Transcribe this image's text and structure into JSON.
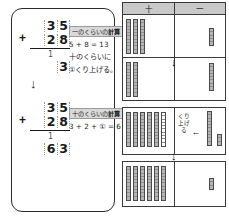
{
  "worksheet": {
    "problem": "35 + 28 = 63",
    "left_panel": {
      "steps": [
        {
          "id": "ones-step",
          "addend_top_tens": "3",
          "addend_top_ones": "5",
          "plus_sign": "+",
          "addend_bottom_tens": "2",
          "addend_bottom_ones": "8",
          "carry_mark": "1",
          "result_tens": "",
          "result_ones": "3",
          "tag_label": "一のくらいの",
          "tag_suffix": "計算",
          "line1": "5 + 8 = 13",
          "line2": "十のくらいに",
          "line3": "①くり上げる。"
        },
        {
          "id": "tens-step",
          "addend_top_tens": "3",
          "addend_top_ones": "5",
          "plus_sign": "+",
          "addend_bottom_tens": "2",
          "addend_bottom_ones": "8",
          "carry_mark": "1",
          "result_tens": "6",
          "result_ones": "3",
          "tag_label": "十のくらいの",
          "tag_suffix": "計算",
          "line1": "3 + 2 + ① = 6",
          "line2": "",
          "line3": ""
        }
      ],
      "down_arrow": "↓"
    },
    "right_panel": {
      "headers": {
        "tens": "十",
        "ones": "一"
      },
      "carry_note": "くり上げる",
      "carry_arrow": "←",
      "connector_arrow": "↓",
      "rows": [
        {
          "id": "addend-1",
          "tens_rods": 3,
          "empty_rods": 0,
          "ones_main": 5,
          "ones_extra": 0
        },
        {
          "id": "addend-2",
          "tens_rods": 2,
          "empty_rods": 0,
          "ones_main": 8,
          "ones_extra": 0
        },
        {
          "id": "regroup",
          "tens_rods": 5,
          "empty_rods": 1,
          "ones_main": 10,
          "ones_extra": 3
        },
        {
          "id": "sum",
          "tens_rods": 6,
          "empty_rods": 0,
          "ones_main": 3,
          "ones_extra": 0
        }
      ]
    }
  }
}
